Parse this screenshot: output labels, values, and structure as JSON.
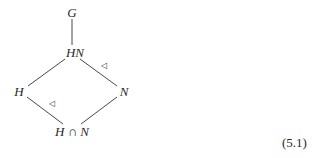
{
  "diagram": {
    "nodes": {
      "top": "G",
      "upper": "HN",
      "left": "H",
      "right": "N",
      "bottom": "H ∩ N"
    },
    "normal_marks": [
      "◁",
      "◁"
    ],
    "equation_number": "(5.1)"
  }
}
